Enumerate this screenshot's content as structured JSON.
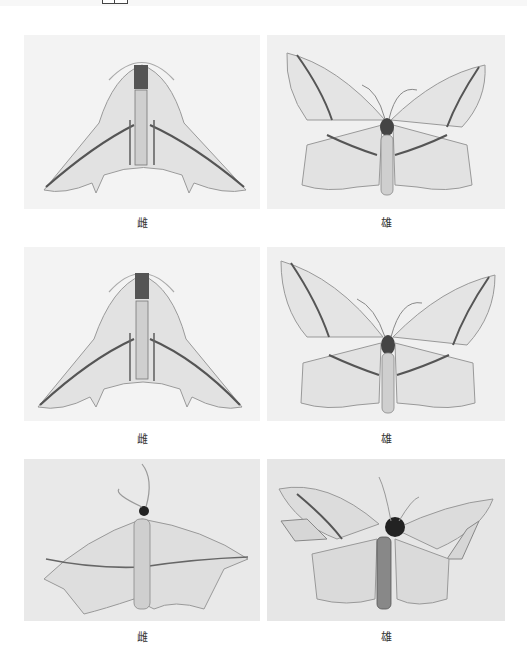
{
  "plates": [
    {
      "row": 1,
      "col": 1,
      "subject": "moth-specimen-wings-folded",
      "caption": "雌"
    },
    {
      "row": 1,
      "col": 2,
      "subject": "moth-specimen-wings-spread",
      "caption": "雄"
    },
    {
      "row": 2,
      "col": 1,
      "subject": "moth-specimen-wings-folded",
      "caption": "雌"
    },
    {
      "row": 2,
      "col": 2,
      "subject": "moth-specimen-wings-spread",
      "caption": "雄"
    },
    {
      "row": 3,
      "col": 1,
      "subject": "moth-live-resting",
      "caption": "雌"
    },
    {
      "row": 3,
      "col": 2,
      "subject": "moth-live-damaged-wings",
      "caption": "雄"
    }
  ]
}
